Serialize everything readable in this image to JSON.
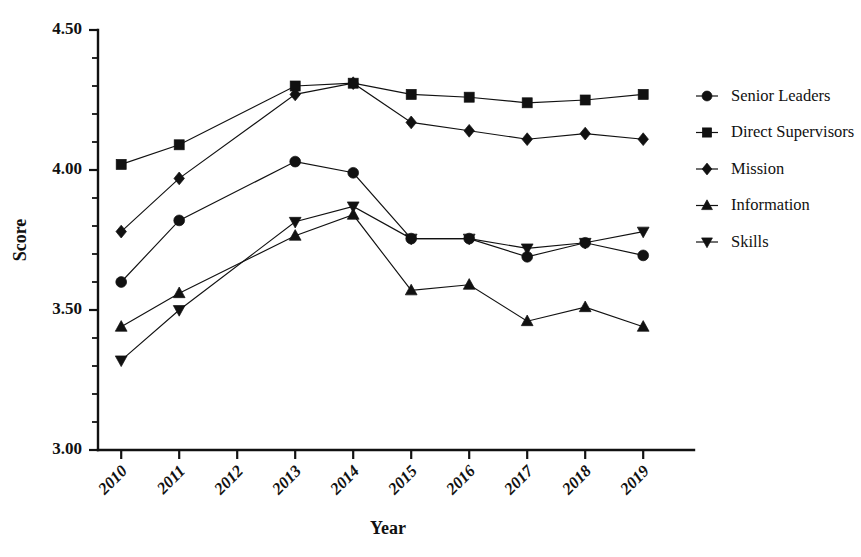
{
  "chart_data": {
    "type": "line",
    "title": "",
    "xlabel": "Year",
    "ylabel": "Score",
    "categories": [
      "2010",
      "2011",
      "2012",
      "2013",
      "2014",
      "2015",
      "2016",
      "2017",
      "2018",
      "2019"
    ],
    "x": [
      2010,
      2011,
      2012,
      2013,
      2014,
      2015,
      2016,
      2017,
      2018,
      2019
    ],
    "xlim": [
      2009.6,
      2019.6
    ],
    "ylim": [
      3.0,
      4.5
    ],
    "yticks": [
      3.0,
      3.5,
      4.0,
      4.5
    ],
    "ytick_labels": [
      "3.00",
      "3.50",
      "4.00",
      "4.50"
    ],
    "ytick_minor_step": 0.1,
    "grid": false,
    "legend_position": "right",
    "missing_year": "2012",
    "series": [
      {
        "name": "Senior Leaders",
        "marker": "circle",
        "values": [
          3.6,
          3.82,
          null,
          4.03,
          3.99,
          3.755,
          3.755,
          3.69,
          3.74,
          3.695
        ]
      },
      {
        "name": "Direct Supervisors",
        "marker": "square",
        "values": [
          4.02,
          4.09,
          null,
          4.3,
          4.31,
          4.27,
          4.26,
          4.24,
          4.25,
          4.27
        ]
      },
      {
        "name": "Mission",
        "marker": "diamond",
        "values": [
          3.78,
          3.97,
          null,
          4.27,
          4.31,
          4.17,
          4.14,
          4.11,
          4.13,
          4.11
        ]
      },
      {
        "name": "Information",
        "marker": "triangle-up",
        "values": [
          3.44,
          3.56,
          null,
          3.765,
          3.84,
          3.57,
          3.59,
          3.46,
          3.51,
          3.44
        ]
      },
      {
        "name": "Skills",
        "marker": "triangle-down",
        "values": [
          3.32,
          3.5,
          null,
          3.815,
          3.87,
          3.755,
          3.755,
          3.72,
          3.74,
          3.78
        ]
      }
    ]
  },
  "axes": {
    "y_title": "Score",
    "x_title": "Year"
  },
  "legend": {
    "entries": [
      {
        "label": "Senior Leaders",
        "marker": "circle"
      },
      {
        "label": "Direct Supervisors",
        "marker": "square"
      },
      {
        "label": "Mission",
        "marker": "diamond"
      },
      {
        "label": "Information",
        "marker": "triangle-up"
      },
      {
        "label": "Skills",
        "marker": "triangle-down"
      }
    ]
  },
  "colors": {
    "ink": "#111111",
    "background": "#ffffff"
  }
}
